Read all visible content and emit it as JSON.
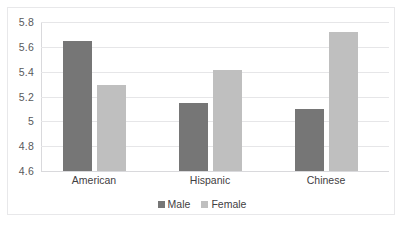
{
  "chart_data": {
    "type": "bar",
    "title": "",
    "subtitle": "",
    "xlabel": "",
    "ylabel": "",
    "categories": [
      "American",
      "Hispanic",
      "Chinese"
    ],
    "series": [
      {
        "name": "Male",
        "values": [
          5.65,
          5.15,
          5.1
        ],
        "color": "#767676"
      },
      {
        "name": "Female",
        "values": [
          5.29,
          5.41,
          5.72
        ],
        "color": "#bfbfbf"
      }
    ],
    "ylim": [
      4.6,
      5.8
    ],
    "ytick_labels": [
      "5.8",
      "5.6",
      "5.4",
      "5.2",
      "5",
      "4.8",
      "4.6"
    ],
    "ytick_values": [
      5.8,
      5.6,
      5.4,
      5.2,
      5.0,
      4.8,
      4.6
    ],
    "grid": true,
    "grid_axis": "y",
    "legend_position": "bottom",
    "legend_entries": [
      "Male",
      "Female"
    ],
    "plot_background": "#ffffff",
    "gridline_color": "#e6e6e8",
    "border_color": "#e8e8ea"
  }
}
